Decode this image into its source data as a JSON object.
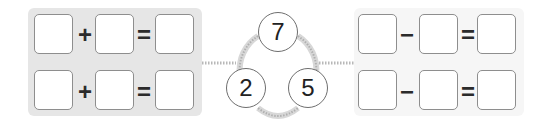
{
  "number_bond": {
    "whole": "7",
    "parts": [
      "2",
      "5"
    ]
  },
  "addition_equations": [
    {
      "operator": "+",
      "equals": "=",
      "first": "",
      "second": "",
      "result": ""
    },
    {
      "operator": "+",
      "equals": "=",
      "first": "",
      "second": "",
      "result": ""
    }
  ],
  "subtraction_equations": [
    {
      "operator": "−",
      "equals": "=",
      "first": "",
      "second": "",
      "result": ""
    },
    {
      "operator": "−",
      "equals": "=",
      "first": "",
      "second": "",
      "result": ""
    }
  ],
  "colors": {
    "left_panel": "#e6e6e6",
    "right_panel": "#f6f6f6",
    "box_border": "#8e8e8e",
    "connector": "#c8c8c8"
  }
}
